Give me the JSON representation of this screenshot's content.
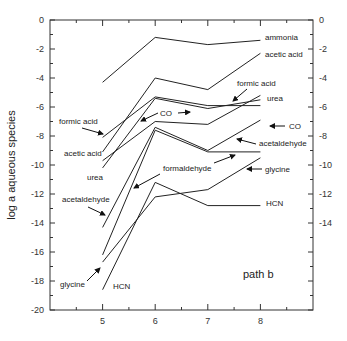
{
  "chart_data": {
    "type": "line",
    "title": "",
    "panel_label": "path b",
    "xlabel": "",
    "ylabel": "log a aqueous species",
    "x": [
      5,
      6,
      7,
      8
    ],
    "xlim": [
      4,
      9
    ],
    "ylim": [
      -20,
      0
    ],
    "xticks": [
      "5",
      "6",
      "7",
      "8"
    ],
    "yticks_left": [
      "0",
      "-2",
      "-4",
      "-6",
      "-8",
      "-10",
      "-12",
      "-14",
      "-16",
      "-18",
      "-20"
    ],
    "yticks_right": [
      "0",
      "-2",
      "-4",
      "-6",
      "-8",
      "-10",
      "-12",
      "-14"
    ],
    "grid": false,
    "series": [
      {
        "name": "ammonia",
        "values": [
          -4.3,
          -1.2,
          -1.7,
          -1.4
        ]
      },
      {
        "name": "acetic acid",
        "values": [
          -9.1,
          -4.0,
          -4.8,
          -2.3
        ]
      },
      {
        "name": "formic acid",
        "values": [
          -8.1,
          -5.3,
          -5.9,
          -5.9
        ]
      },
      {
        "name": "urea",
        "values": [
          -10.2,
          -5.4,
          -6.1,
          -5.5
        ]
      },
      {
        "name": "CO",
        "values": [
          -9.7,
          -7.0,
          -7.2,
          -5.2
        ]
      },
      {
        "name": "acetaldehyde",
        "values": [
          -14.3,
          -7.4,
          -9.0,
          -6.9
        ]
      },
      {
        "name": "formaldehyde",
        "values": [
          -16.2,
          -7.6,
          -9.1,
          -9.1
        ]
      },
      {
        "name": "glycine",
        "values": [
          -16.7,
          -12.2,
          -11.7,
          -9.5
        ]
      },
      {
        "name": "HCN",
        "values": [
          -18.6,
          -11.2,
          -12.8,
          -12.8
        ]
      }
    ],
    "annotations": [
      "ammonia",
      "acetic acid",
      "formic acid",
      "urea",
      "CO",
      "acetaldehyde",
      "formaldehyde",
      "glycine",
      "HCN",
      "formic acid",
      "acetic acid",
      "urea",
      "acetaldehyde",
      "glycine",
      "HCN",
      "CO",
      "path b"
    ]
  },
  "labels": {
    "ylabel": "log a aqueous species",
    "panel": "path b",
    "right": {
      "ammonia": "ammonia",
      "acetic_acid": "acetic acid",
      "formic_acid": "formic acid",
      "urea": "urea",
      "co": "CO",
      "acetaldehyde": "acetaldehyde",
      "glycine": "glycine",
      "hcn": "HCN"
    },
    "left": {
      "formic_acid": "formic acid",
      "acetic_acid": "acetic acid",
      "urea": "urea",
      "acetaldehyde": "acetaldehyde",
      "glycine": "glycine",
      "hcn": "HCN"
    },
    "middle": {
      "co": "CO",
      "formaldehyde": "formaldehyde"
    }
  },
  "colors": {
    "line": "#222222",
    "axis": "#333333",
    "background": "#ffffff"
  }
}
